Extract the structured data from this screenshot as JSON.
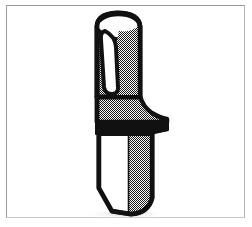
{
  "image": {
    "title": "Knife with hollow tubular handle",
    "subject": "knife",
    "style": "black-and-white halftone line art illustration",
    "background_color": "#ffffff",
    "outline_color": "#111111",
    "shade_color": "#8a8a8a",
    "highlight_color": "#ffffff",
    "frame": {
      "name": "picture-frame-border",
      "top_color": "#9a9a9a",
      "left_color": "#9a9a9a",
      "right_color": "#b4b4b4",
      "bottom_color": "#c8c8c8",
      "thickness_px": 1.5
    },
    "parts": [
      {
        "name": "handle",
        "description": "hollow tube-like grip, open at the top, shaded with halftone dither on the right face and a white highlight channel on the left"
      },
      {
        "name": "handle-opening",
        "description": "elliptical open mouth at top of the handle"
      },
      {
        "name": "handle-highlight",
        "description": "narrow white U-shaped specular stripe running down the left side of the grip"
      },
      {
        "name": "bolster-guard",
        "description": "flared finger guard that curves outward to the right below the grip"
      },
      {
        "name": "guard-band",
        "description": "solid black horizontal band separating the guard from the blade"
      },
      {
        "name": "blade",
        "description": "long blade, white bevel on the left, halftone shaded on the right, with a rounded point"
      },
      {
        "name": "blade-bevel",
        "description": "white flat grind along the left face of the blade"
      },
      {
        "name": "blade-tip",
        "description": "rounded tip angling in from the left edge"
      }
    ]
  }
}
